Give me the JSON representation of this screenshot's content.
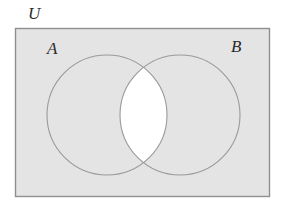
{
  "figure": {
    "type": "venn-diagram",
    "labels": {
      "universe": "U",
      "set_a": "A",
      "set_b": "B"
    },
    "colors": {
      "page_background": "#ffffff",
      "universe_fill": "#e4e4e4",
      "universe_stroke": "#8f8f8f",
      "circle_stroke": "#9a9a9a",
      "intersection_fill": "#ffffff",
      "label_color": "#2b2b2b"
    },
    "geometry": {
      "universe_rect": {
        "x": 15,
        "y": 28,
        "width": 255,
        "height": 169
      },
      "circle_a": {
        "cx": 107,
        "cy": 115,
        "r": 60
      },
      "circle_b": {
        "cx": 180,
        "cy": 115,
        "r": 60
      }
    },
    "shaded_regions": [
      "A only",
      "B only",
      "outside A and B within U"
    ],
    "unshaded_regions": [
      "A intersect B"
    ]
  }
}
